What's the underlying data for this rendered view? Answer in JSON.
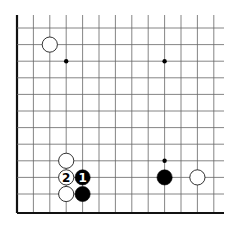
{
  "board": {
    "line_color": "#666666",
    "edge_color": "#111111",
    "columns_x": [
      17,
      33.4,
      49.8,
      66.2,
      82.6,
      99,
      115.4,
      131.8,
      148.2,
      164.6,
      181,
      197.4,
      213.8
    ],
    "rows_y": [
      28,
      44.6,
      61.2,
      77.8,
      94.4,
      111,
      127.6,
      144.2,
      160.8,
      177.4,
      194,
      213
    ],
    "top_y": 15,
    "right_x": 224,
    "left_edge_x": 17,
    "bottom_edge_y": 213
  },
  "star_points": [
    {
      "x": 66.2,
      "y": 61.2
    },
    {
      "x": 164.6,
      "y": 61.2
    },
    {
      "x": 164.6,
      "y": 160.8
    }
  ],
  "stones": [
    {
      "color": "white",
      "x": 49.8,
      "y": 44.6,
      "label": ""
    },
    {
      "color": "white",
      "x": 66.2,
      "y": 160.8,
      "label": ""
    },
    {
      "color": "white",
      "x": 66.2,
      "y": 177.4,
      "label": "2"
    },
    {
      "color": "black",
      "x": 82.6,
      "y": 177.4,
      "label": "1"
    },
    {
      "color": "white",
      "x": 66.2,
      "y": 194,
      "label": ""
    },
    {
      "color": "black",
      "x": 82.6,
      "y": 194,
      "label": ""
    },
    {
      "color": "black",
      "x": 164.6,
      "y": 177.4,
      "label": ""
    },
    {
      "color": "white",
      "x": 197.4,
      "y": 177.4,
      "label": ""
    }
  ],
  "move_labels": {
    "move1": "1",
    "move2": "2"
  }
}
